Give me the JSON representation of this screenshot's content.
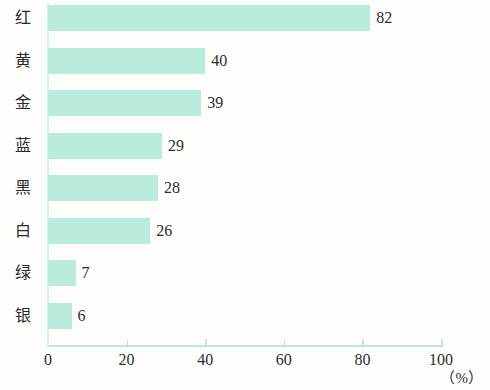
{
  "chart_data": {
    "type": "bar",
    "orientation": "horizontal",
    "title": "",
    "subtitle": "",
    "xlabel": "（%）",
    "ylabel": "",
    "categories": [
      "红",
      "黄",
      "金",
      "蓝",
      "黑",
      "白",
      "绿",
      "银"
    ],
    "values": [
      82,
      40,
      39,
      29,
      28,
      26,
      7,
      6
    ],
    "value_labels": [
      "82",
      "40",
      "39",
      "29",
      "28",
      "26",
      "7",
      "6"
    ],
    "xlim": [
      0,
      100
    ],
    "xticks": [
      0,
      20,
      40,
      60,
      80,
      100
    ],
    "xtick_labels": [
      "0",
      "20",
      "40",
      "60",
      "80",
      "100"
    ],
    "grid": false,
    "legend": null,
    "series": [
      {
        "name": "",
        "values": [
          82,
          40,
          39,
          29,
          28,
          26,
          7,
          6
        ]
      }
    ],
    "colors": {
      "bar": "#b9ecdc",
      "axis": "#bfe6db",
      "text": "#2d2d2d",
      "background": "#fdfdfb"
    }
  }
}
